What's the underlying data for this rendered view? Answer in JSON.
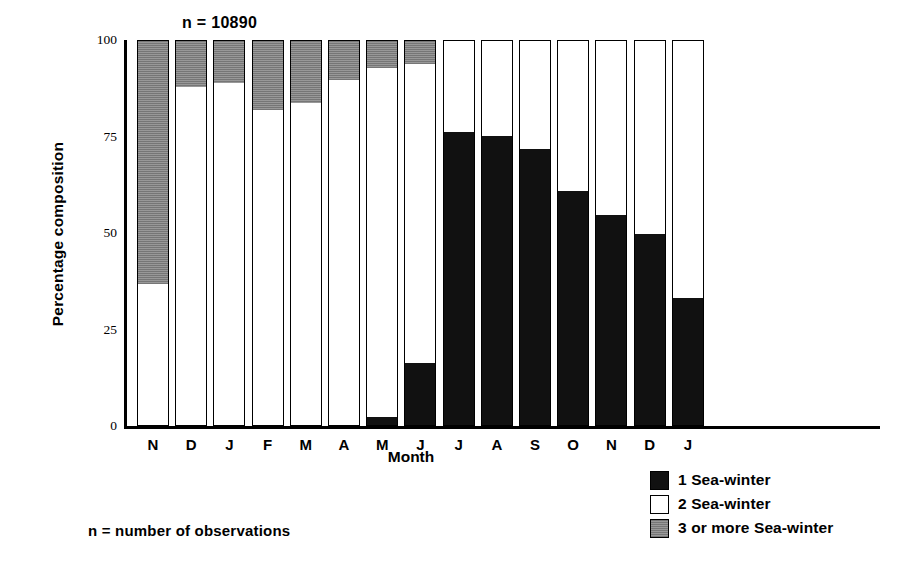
{
  "chart_data": {
    "type": "bar",
    "stacked": true,
    "title": "",
    "annotation": "n = 10890",
    "footnote": "n = number of observations",
    "xlabel": "Month",
    "ylabel": "Percentage composition",
    "ylim": [
      0,
      100
    ],
    "yticks": [
      0,
      25,
      50,
      75,
      100
    ],
    "ytick_labels": [
      "0",
      "25",
      "50",
      "75",
      "100"
    ],
    "grid": false,
    "legend_position": "bottom-right",
    "categories": [
      "N",
      "D",
      "J",
      "F",
      "M",
      "A",
      "M",
      "J",
      "J",
      "A",
      "S",
      "O",
      "N",
      "D",
      "J"
    ],
    "series": [
      {
        "name": "1 Sea-winter",
        "color": "#111111",
        "values": [
          0,
          0,
          0,
          0,
          0,
          0,
          2,
          16,
          76,
          75,
          71.5,
          60.5,
          54.5,
          49.5,
          33
        ]
      },
      {
        "name": "2 Sea-winter",
        "color": "#ffffff",
        "values": [
          37,
          88,
          89,
          82,
          84,
          90,
          91,
          78,
          24,
          25,
          28.5,
          39.5,
          45.5,
          50.5,
          67
        ]
      },
      {
        "name": "3 or more Sea-winter",
        "color": "#8d8d8d",
        "values": [
          63,
          12,
          11,
          18,
          16,
          10,
          7,
          6,
          0,
          0,
          0,
          0,
          0,
          0,
          0
        ]
      }
    ]
  },
  "legend": {
    "entries": [
      {
        "label": "1 Sea-winter",
        "swatch": "black"
      },
      {
        "label": "2 Sea-winter",
        "swatch": "white"
      },
      {
        "label": "3 or more Sea-winter",
        "swatch": "gray"
      }
    ]
  }
}
